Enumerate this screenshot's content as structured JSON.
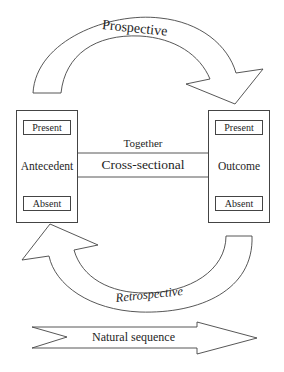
{
  "diagram": {
    "top_arrow": {
      "label": "Prospective",
      "direction": "antecedent-to-outcome"
    },
    "bottom_arrow": {
      "label": "Retrospective",
      "direction": "outcome-to-antecedent"
    },
    "left_box": {
      "title": "Antecedent",
      "top_state": "Present",
      "bottom_state": "Absent"
    },
    "right_box": {
      "title": "Outcome",
      "top_state": "Present",
      "bottom_state": "Absent"
    },
    "connector": {
      "above_label": "Together",
      "label": "Cross-sectional"
    },
    "sequence_arrow": {
      "label": "Natural sequence"
    },
    "colors": {
      "stroke": "#444444",
      "fill": "#ffffff",
      "text": "#1e1e1e"
    }
  }
}
